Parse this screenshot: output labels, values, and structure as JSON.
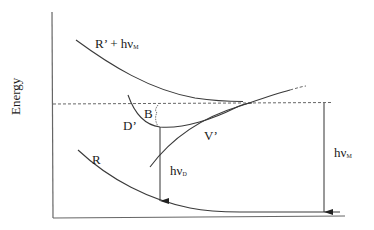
{
  "diagram": {
    "type": "potential-energy-curve-diagram",
    "axis": {
      "y_label": "Energy"
    },
    "curves": {
      "upper_repulsive": {
        "label_main": "R’ + hν",
        "label_sub": "M"
      },
      "dissociative": {
        "label": "D’"
      },
      "barrier": {
        "label": "B"
      },
      "vibronic": {
        "label": "V’"
      },
      "ground_repulsive": {
        "label": "R"
      }
    },
    "transitions": {
      "dissociation_emission": {
        "label_main": "hν",
        "label_sub": "D"
      },
      "molecular_emission": {
        "label_main": "hν",
        "label_sub": "M"
      }
    },
    "colors": {
      "line": "#3a3a3a",
      "text": "#1a1a1a",
      "dashed": "#555555"
    }
  }
}
